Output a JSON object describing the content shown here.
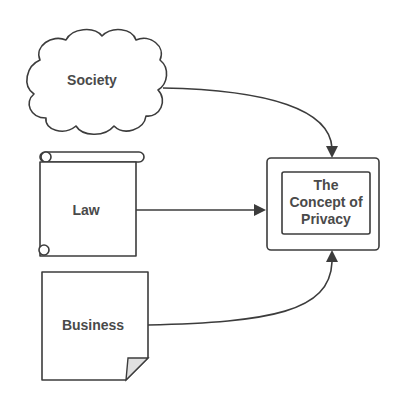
{
  "diagram": {
    "nodes": [
      {
        "id": "society",
        "label": "Society",
        "shape": "cloud"
      },
      {
        "id": "law",
        "label": "Law",
        "shape": "scroll"
      },
      {
        "id": "business",
        "label": "Business",
        "shape": "document-folded-corner"
      },
      {
        "id": "privacy",
        "label_lines": [
          "The",
          "Concept of",
          "Privacy"
        ],
        "shape": "double-box"
      }
    ],
    "edges": [
      {
        "from": "society",
        "to": "privacy",
        "style": "curved-arrow"
      },
      {
        "from": "law",
        "to": "privacy",
        "style": "straight-arrow"
      },
      {
        "from": "business",
        "to": "privacy",
        "style": "curved-arrow"
      }
    ],
    "colors": {
      "stroke": "#3c3c3c",
      "text": "#4a4a4a",
      "background": "#ffffff",
      "fold": "#e0e0e0"
    }
  }
}
